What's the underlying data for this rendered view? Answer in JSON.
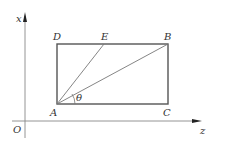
{
  "diagram": {
    "axes": {
      "vertical_label": "x",
      "horizontal_label": "z",
      "origin_label": "O"
    },
    "points": {
      "A": "A",
      "B": "B",
      "C": "C",
      "D": "D",
      "E": "E"
    },
    "angle_label": "θ",
    "colors": {
      "rect_stroke": "#555555",
      "line_stroke": "#777777",
      "axis_stroke": "#888888",
      "arrow_fill": "#222222",
      "label": "#333333"
    }
  }
}
